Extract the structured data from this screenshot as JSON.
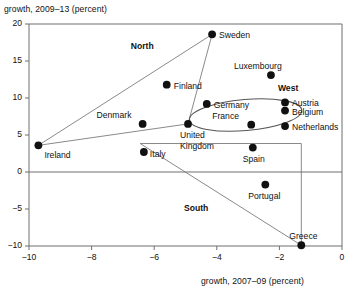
{
  "chart_data": {
    "type": "scatter",
    "title": "",
    "xlabel": "growth, 2007–09 (percent)",
    "ylabel": "growth, 2009–13 (percent)",
    "xlim": [
      -10,
      0
    ],
    "ylim": [
      -10,
      20
    ],
    "xticks": [
      -10,
      -8,
      -6,
      -4,
      -2,
      0
    ],
    "xticklabels": [
      "−10",
      "−8",
      "−6",
      "−4",
      "−2",
      "0"
    ],
    "yticks": [
      -10,
      -5,
      0,
      5,
      10,
      15,
      20
    ],
    "yticklabels": [
      "−10",
      "−5",
      "0",
      "5",
      "10",
      "15",
      "20"
    ],
    "grid": false,
    "legend": null,
    "points": [
      {
        "name": "Sweden",
        "x": -4.15,
        "y": 18.6,
        "label_dx": 7,
        "label_dy": -4
      },
      {
        "name": "Luxembourg",
        "x": -2.27,
        "y": 13.1,
        "label_dx": -37,
        "label_dy": -14
      },
      {
        "name": "Finland",
        "x": -5.6,
        "y": 11.8,
        "label_dx": 7,
        "label_dy": -4
      },
      {
        "name": "Austria",
        "x": -1.82,
        "y": 9.4,
        "label_dx": 7,
        "label_dy": -4
      },
      {
        "name": "Germany",
        "x": -4.32,
        "y": 9.2,
        "label_dx": 7,
        "label_dy": -4
      },
      {
        "name": "Belgium",
        "x": -1.82,
        "y": 8.3,
        "label_dx": 7,
        "label_dy": -4
      },
      {
        "name": "Denmark",
        "x": -6.37,
        "y": 6.5,
        "label_dx": -46,
        "label_dy": -14
      },
      {
        "name": "United Kingdom",
        "x": -4.92,
        "y": 6.5,
        "label_dx": -8,
        "label_dy": 6
      },
      {
        "name": "France",
        "x": -2.9,
        "y": 6.4,
        "label_dx": -39,
        "label_dy": -14
      },
      {
        "name": "Netherlands",
        "x": -1.82,
        "y": 6.2,
        "label_dx": 7,
        "label_dy": -4
      },
      {
        "name": "Ireland",
        "x": -9.7,
        "y": 3.6,
        "label_dx": 6,
        "label_dy": 5
      },
      {
        "name": "Spain",
        "x": -2.85,
        "y": 3.3,
        "label_dx": -10,
        "label_dy": 6
      },
      {
        "name": "Italy",
        "x": -6.33,
        "y": 2.7,
        "label_dx": 6,
        "label_dy": -3
      },
      {
        "name": "Portugal",
        "x": -2.45,
        "y": -1.7,
        "label_dx": -17,
        "label_dy": 6
      },
      {
        "name": "Greece",
        "x": -1.3,
        "y": -9.9,
        "label_dx": -12,
        "label_dy": -14
      }
    ],
    "region_annotations": [
      {
        "name": "North",
        "text": "North",
        "x": -6.3,
        "y": 16.9
      },
      {
        "name": "West",
        "text": "West",
        "x": -1.6,
        "y": 11.2
      },
      {
        "name": "South",
        "text": "South",
        "x": -4.6,
        "y": -5.0
      }
    ],
    "groupings": [
      {
        "name": "north-triangle",
        "shape": "polygon",
        "members": [
          "Ireland",
          "Sweden",
          "United Kingdom",
          "Denmark"
        ],
        "vertices": [
          [
            -9.7,
            3.6
          ],
          [
            -4.15,
            18.6
          ],
          [
            -4.92,
            6.5
          ]
        ]
      },
      {
        "name": "west-ellipse",
        "shape": "ellipse",
        "members": [
          "Germany",
          "France",
          "Austria",
          "Belgium",
          "Netherlands"
        ],
        "center": [
          -3.08,
          7.7
        ],
        "radius_x": 1.8,
        "radius_y": 2.1,
        "rotation_deg": -5
      },
      {
        "name": "south-quad",
        "shape": "polygon",
        "members": [
          "Italy",
          "Spain",
          "Portugal",
          "Greece"
        ],
        "vertices": [
          [
            -6.45,
            3.85
          ],
          [
            -1.3,
            3.85
          ],
          [
            -1.3,
            -9.9
          ],
          [
            -6.45,
            3.85
          ]
        ]
      }
    ],
    "colors": {
      "point": "#111111",
      "axis": "#6f6f6f",
      "grouping": "#8a8a8a",
      "text": "#111111",
      "background": "#ffffff"
    }
  }
}
